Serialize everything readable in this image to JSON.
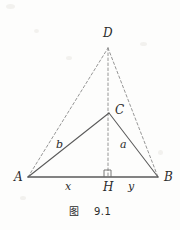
{
  "figure": {
    "caption": "图    9.1",
    "stroke_solid_color": "#5a5a5a",
    "stroke_dashed_color": "#8a8a8a",
    "background_color": "#fdfdfc",
    "text_color": "#2b2b2b",
    "vertices": [
      {
        "id": "A",
        "label": "A",
        "x": 28,
        "y": 177,
        "label_x": 14,
        "label_y": 171
      },
      {
        "id": "B",
        "label": "B",
        "x": 158,
        "y": 177,
        "label_x": 164,
        "label_y": 171
      },
      {
        "id": "C",
        "label": "C",
        "x": 109,
        "y": 113,
        "label_x": 115,
        "label_y": 104
      },
      {
        "id": "D",
        "label": "D",
        "x": 108,
        "y": 48,
        "label_x": 103,
        "label_y": 27
      },
      {
        "id": "H",
        "label": "H",
        "x": 108,
        "y": 177,
        "label_x": 103,
        "label_y": 181
      }
    ],
    "solid_edges": [
      {
        "name": "segment-AC",
        "from": "A",
        "to": "C"
      },
      {
        "name": "segment-CB",
        "from": "C",
        "to": "B"
      },
      {
        "name": "segment-AB",
        "from": "A",
        "to": "B"
      }
    ],
    "dashed_edges": [
      {
        "name": "segment-AD",
        "from": "A",
        "to": "D"
      },
      {
        "name": "segment-DB",
        "from": "D",
        "to": "B"
      },
      {
        "name": "segment-DH",
        "from": "D",
        "to": "H"
      }
    ],
    "side_labels": [
      {
        "id": "b",
        "label": "b",
        "x": 56,
        "y": 139,
        "desc": "side-label-b"
      },
      {
        "id": "a",
        "label": "a",
        "x": 120,
        "y": 139,
        "desc": "side-label-a"
      }
    ],
    "segment_labels": [
      {
        "id": "x",
        "label": "x",
        "x": 65,
        "y": 181,
        "desc": "segment-label-x"
      },
      {
        "id": "y",
        "label": "y",
        "x": 128,
        "y": 181,
        "desc": "segment-label-y"
      }
    ],
    "right_angle": {
      "name": "right-angle-mark-at-H",
      "x": 104,
      "y": 170,
      "size": 7
    },
    "caption_y": 203
  }
}
